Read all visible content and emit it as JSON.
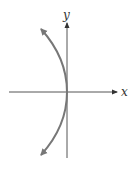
{
  "figure": {
    "type": "parabola graph (opens left)",
    "x_axis_label": "x",
    "y_axis_label": "y",
    "colors": {
      "axes": "#555555",
      "curve": "#777777",
      "background": "#ffffff"
    }
  }
}
